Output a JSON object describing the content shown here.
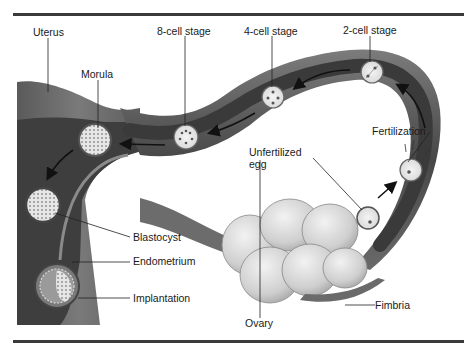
{
  "figure": {
    "colors": {
      "rule": "#3a3a3a",
      "tissue_dark": "#3c3c3c",
      "tissue_mid": "#6e6e6e",
      "tissue_light": "#9a9a9a",
      "ovary": "#d4d4d4",
      "cell": "#e8e8e8",
      "text": "#1a1a1a"
    },
    "labels": {
      "uterus": "Uterus",
      "eight_cell": "8-cell stage",
      "four_cell": "4-cell stage",
      "two_cell": "2-cell stage",
      "morula": "Morula",
      "fertilization": "Fertilization",
      "unfertilized_egg_line1": "Unfertilized",
      "unfertilized_egg_line2": "egg",
      "blastocyst": "Blastocyst",
      "endometrium": "Endometrium",
      "implantation": "Implantation",
      "ovary": "Ovary",
      "fimbria": "Fimbria"
    },
    "stages_in_order": [
      "Unfertilized egg",
      "Fertilization",
      "2-cell stage",
      "4-cell stage",
      "8-cell stage",
      "Morula",
      "Blastocyst",
      "Implantation"
    ]
  }
}
